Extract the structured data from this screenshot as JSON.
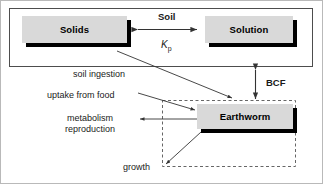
{
  "diagram": {
    "compartments": {
      "soil": {
        "label": "Soil",
        "style": "solid-border"
      },
      "earthworm": {
        "label": "",
        "style": "dashed-border"
      }
    },
    "nodes": [
      {
        "id": "solids",
        "label": "Solids"
      },
      {
        "id": "solution",
        "label": "Solution"
      },
      {
        "id": "earthworm",
        "label": "Earthworm"
      }
    ],
    "labels": {
      "soil": "Soil",
      "kp_symbol": "K",
      "kp_subscript": "p",
      "soil_ingestion": "soil ingestion",
      "bcf": "BCF",
      "uptake_from_food": "uptake from food",
      "metabolism": "metabolism",
      "reproduction": "reproduction",
      "growth": "growth"
    },
    "edges": [
      {
        "from": "solids",
        "to": "solution",
        "label": "Soil / Kp",
        "arrow": "double",
        "orientation": "horizontal"
      },
      {
        "from": "solution",
        "to": "earthworm",
        "label": "BCF",
        "arrow": "double",
        "orientation": "vertical"
      },
      {
        "from": "solids",
        "to": "earthworm",
        "label": "soil ingestion",
        "arrow": "single",
        "orientation": "diagonal"
      },
      {
        "from": "food",
        "to": "earthworm",
        "label": "uptake from food",
        "arrow": "single",
        "orientation": "diagonal"
      },
      {
        "from": "earthworm",
        "to": "loss",
        "label": "metabolism reproduction",
        "arrow": "single",
        "orientation": "horizontal"
      },
      {
        "from": "earthworm",
        "to": "growth",
        "label": "growth",
        "arrow": "single",
        "orientation": "diagonal"
      }
    ],
    "colors": {
      "node_fill": "#d9d9d9",
      "node_shadow": "#000000",
      "outer_border": "#b9b9b9",
      "compartment_border": "#4d4d4d",
      "dashed_border": "#666666",
      "arrow": "#333333",
      "text": "#000000"
    }
  }
}
